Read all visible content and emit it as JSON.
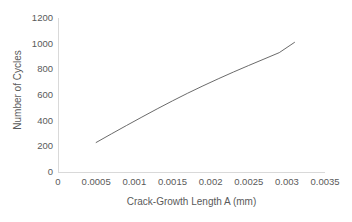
{
  "chart_data": {
    "type": "line",
    "title": "",
    "xlabel": "Crack-Growth Length A (mm)",
    "ylabel": "Number of Cycles",
    "xlim": [
      0,
      0.0035
    ],
    "ylim": [
      0,
      1200
    ],
    "grid": false,
    "legend": false,
    "xticks": [
      "0",
      "0.0005",
      "0.001",
      "0.0015",
      "0.002",
      "0.0025",
      "0.003",
      "0.0035"
    ],
    "xtick_values": [
      0,
      0.0005,
      0.001,
      0.0015,
      0.002,
      0.0025,
      0.003,
      0.0035
    ],
    "yticks": [
      "0",
      "200",
      "400",
      "600",
      "800",
      "1000",
      "1200"
    ],
    "ytick_values": [
      0,
      200,
      400,
      600,
      800,
      1000,
      1200
    ],
    "series": [
      {
        "name": "Number of Cycles",
        "color": "#595959",
        "x": [
          0.0005,
          0.0007,
          0.0009,
          0.0011,
          0.0013,
          0.0015,
          0.0017,
          0.0019,
          0.0021,
          0.0023,
          0.0025,
          0.0027,
          0.0029,
          0.0031
        ],
        "y": [
          230,
          297,
          363,
          428,
          492,
          554,
          614,
          671,
          726,
          779,
          830,
          880,
          930,
          1010
        ]
      }
    ]
  },
  "axis_colors": {
    "axis_line": "#d9d9d9",
    "tick_text": "#5a5a5a",
    "series_line": "#595959",
    "background": "#ffffff"
  }
}
